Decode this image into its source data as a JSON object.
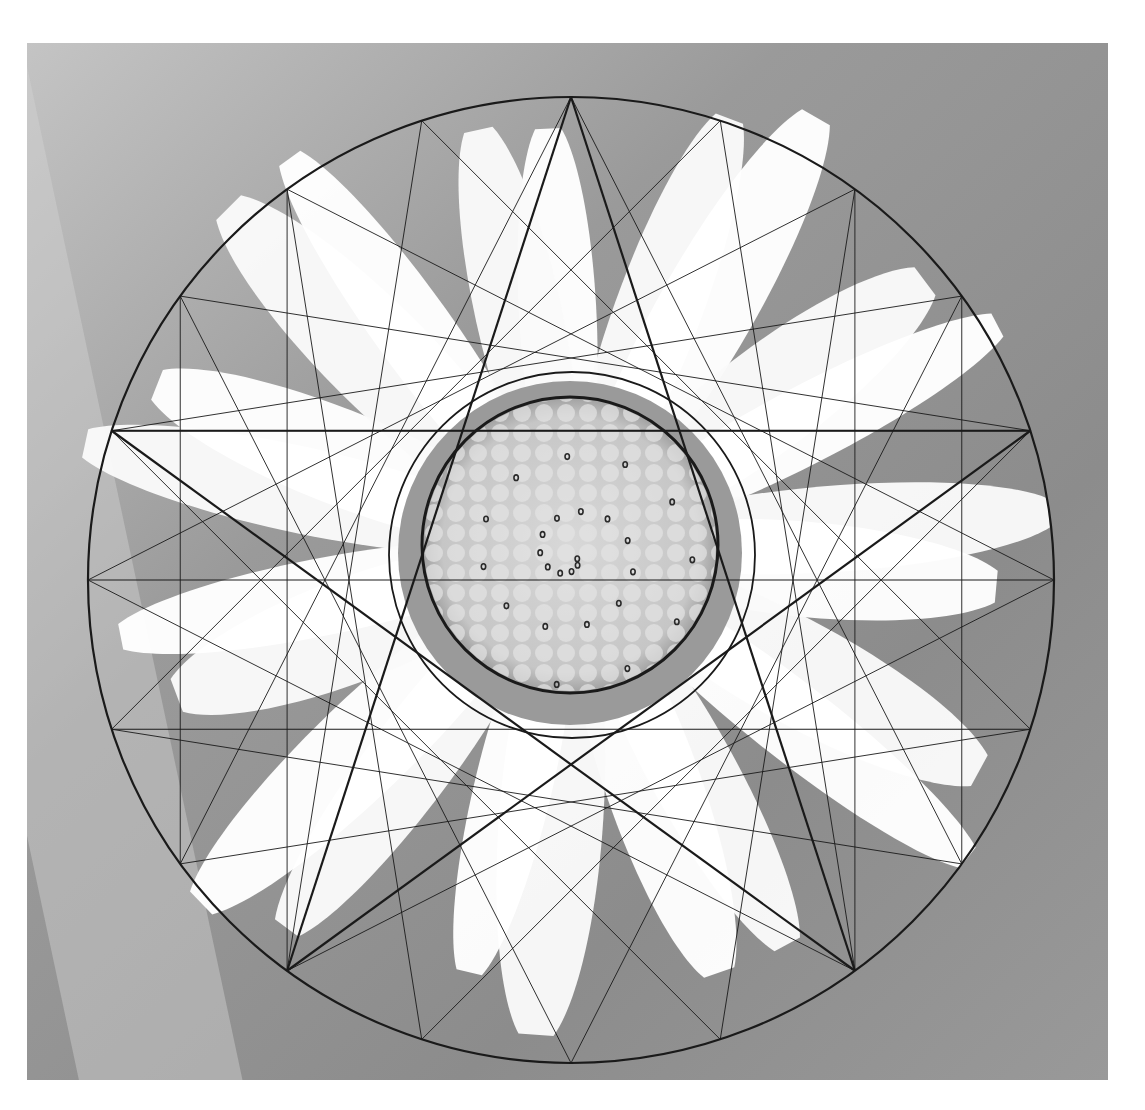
{
  "image": {
    "description": "Grayscale photograph of a daisy-like flower with a geometric construction overlay: an outer circle divided into 20 points, a bold pentagram, thin star chords and vertical lines, two inner circles around the flower disc, and a spiral of small dots on the disc.",
    "colors": {
      "background_light": "#bdbdbd",
      "background_dark": "#8a8a8a",
      "petal": "#ffffff",
      "disc": "#cfcfcf",
      "line": "#1a1a1a"
    },
    "geometry": {
      "outer_circle": {
        "cx": 544,
        "cy": 537,
        "r": 483
      },
      "inner_thin_circle": {
        "cx": 545,
        "cy": 512,
        "r": 183
      },
      "inner_thick_circle": {
        "cx": 543,
        "cy": 502,
        "r": 148
      },
      "division_points": 20,
      "pentagram_step": 8,
      "thin_star_step": 7
    }
  }
}
